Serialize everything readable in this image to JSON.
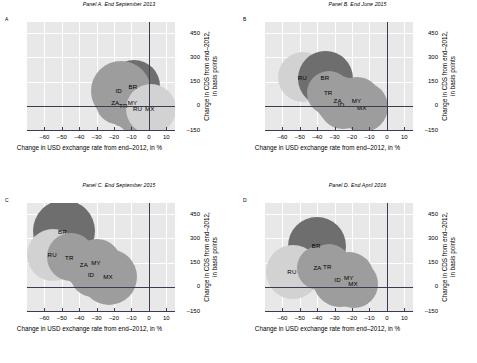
{
  "figure": {
    "axis_x_label": "Change in USD exchange rate from end–2012, in %",
    "axis_y_label_line1": "Change in CDS from end–2012,",
    "axis_y_label_line2": "in basis points",
    "x_ticks": [
      "–60",
      "–50",
      "–40",
      "–30",
      "–20",
      "–10",
      "0",
      "10"
    ],
    "y_ticks": [
      "450",
      "300",
      "150",
      "0",
      "–150"
    ],
    "x_min": -70,
    "x_max": 15,
    "y_min": -150,
    "y_max": 520,
    "colors": {
      "plot_bg": "#e8e8e8",
      "gridline": "#ffffff",
      "axis": "#3b3b52",
      "bubble_dark": "#6e6e6e",
      "bubble_mid": "#9d9d9d",
      "bubble_light": "#d2d2d2"
    }
  },
  "chart_data": [
    {
      "type": "scatter",
      "panel": "A",
      "title": "Panel A. End September 2013",
      "xlabel": "Change in USD exchange rate from end–2012, in %",
      "ylabel": "Change in CDS from end–2012, in basis points",
      "xlim": [
        -70,
        15
      ],
      "ylim": [
        -150,
        520
      ],
      "grid": true,
      "points": [
        {
          "label": "BR",
          "x": -8.5,
          "y": 120,
          "size": 52,
          "color": "#6e6e6e"
        },
        {
          "label": "ID",
          "x": -16.0,
          "y": 92,
          "size": 60,
          "color": "#9d9d9d"
        },
        {
          "label": "ZA",
          "x": -18.5,
          "y": 18,
          "size": 42,
          "color": "#9d9d9d"
        },
        {
          "label": "TR",
          "x": -14.0,
          "y": 0,
          "size": 42,
          "color": "#9d9d9d"
        },
        {
          "label": "MY",
          "x": -9.0,
          "y": 22,
          "size": 44,
          "color": "#9d9d9d"
        },
        {
          "label": "RU",
          "x": -6.0,
          "y": -18,
          "size": 50,
          "color": "#9d9d9d"
        },
        {
          "label": "MX",
          "x": 1.0,
          "y": -20,
          "size": 50,
          "color": "#d2d2d2"
        }
      ]
    },
    {
      "type": "scatter",
      "panel": "B",
      "title": "Panel B. End June 2015",
      "xlabel": "Change in USD exchange rate from end–2012, in %",
      "ylabel": "Change in CDS from end–2012, in basis points",
      "xlim": [
        -70,
        15
      ],
      "ylim": [
        -150,
        520
      ],
      "grid": true,
      "points": [
        {
          "label": "RU",
          "x": -48.0,
          "y": 178,
          "size": 50,
          "color": "#d2d2d2"
        },
        {
          "label": "BR",
          "x": -35.0,
          "y": 172,
          "size": 55,
          "color": "#6e6e6e"
        },
        {
          "label": "TR",
          "x": -33.0,
          "y": 80,
          "size": 44,
          "color": "#9d9d9d"
        },
        {
          "label": "ZA",
          "x": -27.5,
          "y": 35,
          "size": 48,
          "color": "#9d9d9d"
        },
        {
          "label": "ID",
          "x": -25.0,
          "y": 8,
          "size": 48,
          "color": "#9d9d9d"
        },
        {
          "label": "MY",
          "x": -17.0,
          "y": 30,
          "size": 48,
          "color": "#9d9d9d"
        },
        {
          "label": "MX",
          "x": -14.0,
          "y": -8,
          "size": 50,
          "color": "#9d9d9d"
        }
      ]
    },
    {
      "type": "scatter",
      "panel": "C",
      "title": "Panel C. End September 2015",
      "xlabel": "Change in USD exchange rate from end–2012, in %",
      "ylabel": "Change in CDS from end–2012, in basis points",
      "xlim": [
        -70,
        15
      ],
      "ylim": [
        -150,
        520
      ],
      "grid": true,
      "points": [
        {
          "label": "BR",
          "x": -49.0,
          "y": 345,
          "size": 62,
          "color": "#6e6e6e"
        },
        {
          "label": "RU",
          "x": -55.0,
          "y": 198,
          "size": 52,
          "color": "#d2d2d2"
        },
        {
          "label": "TR",
          "x": -45.0,
          "y": 182,
          "size": 48,
          "color": "#9d9d9d"
        },
        {
          "label": "ZA",
          "x": -36.5,
          "y": 140,
          "size": 46,
          "color": "#9d9d9d"
        },
        {
          "label": "MY",
          "x": -30.0,
          "y": 150,
          "size": 48,
          "color": "#9d9d9d"
        },
        {
          "label": "ID",
          "x": -32.0,
          "y": 78,
          "size": 46,
          "color": "#9d9d9d"
        },
        {
          "label": "MX",
          "x": -23.0,
          "y": 62,
          "size": 56,
          "color": "#9d9d9d"
        }
      ]
    },
    {
      "type": "scatter",
      "panel": "D",
      "title": "Panel D. End April 2016",
      "xlabel": "Change in USD exchange rate from end–2012, in %",
      "ylabel": "Change in CDS from end–2012, in basis points",
      "xlim": [
        -70,
        15
      ],
      "ylim": [
        -150,
        520
      ],
      "grid": true,
      "points": [
        {
          "label": "BR",
          "x": -40.0,
          "y": 255,
          "size": 58,
          "color": "#6e6e6e"
        },
        {
          "label": "RU",
          "x": -54.0,
          "y": 92,
          "size": 54,
          "color": "#d2d2d2"
        },
        {
          "label": "ZA",
          "x": -39.0,
          "y": 118,
          "size": 44,
          "color": "#9d9d9d"
        },
        {
          "label": "TR",
          "x": -33.5,
          "y": 128,
          "size": 44,
          "color": "#9d9d9d"
        },
        {
          "label": "ID",
          "x": -27.0,
          "y": 42,
          "size": 54,
          "color": "#9d9d9d"
        },
        {
          "label": "MY",
          "x": -21.5,
          "y": 58,
          "size": 50,
          "color": "#9d9d9d"
        },
        {
          "label": "MX",
          "x": -19.0,
          "y": 18,
          "size": 48,
          "color": "#9d9d9d"
        }
      ]
    }
  ]
}
